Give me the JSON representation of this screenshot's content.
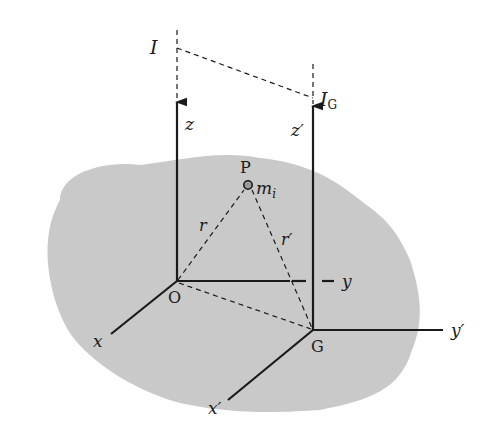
{
  "diagram": {
    "colors": {
      "body_fill": "#c9c9c9",
      "line": "#1a1a1a",
      "background": "#ffffff"
    },
    "labels": {
      "I": "I",
      "I_G_main": "I",
      "I_G_sub": "G",
      "z": "z",
      "z_prime": "z′",
      "P": "P",
      "m_main": "m",
      "m_sub": "i",
      "r": "r",
      "r_prime": "r′",
      "O": "O",
      "G": "G",
      "y": "y",
      "y_prime": "y′",
      "x": "x",
      "x_prime": "x′"
    }
  }
}
